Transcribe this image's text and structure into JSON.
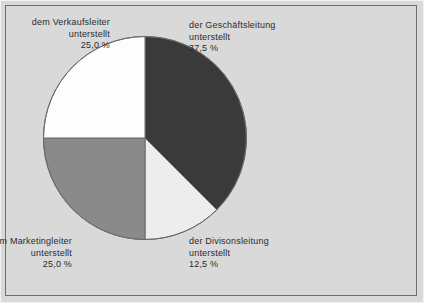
{
  "chart_data": {
    "type": "pie",
    "title": "",
    "subtitle": "",
    "xlabel": "",
    "ylabel": "",
    "legend_position": "none",
    "grid": false,
    "start_angle_deg": 0,
    "direction": "clockwise",
    "categories": [
      "der Geschäftsleitung unterstellt",
      "der Divisonsleitung unterstellt",
      "dem Marketingleiter unterstellt",
      "dem Verkaufsleiter unterstellt"
    ],
    "values": [
      37.5,
      12.5,
      25.0,
      25.0
    ],
    "value_labels": [
      "37,5 %",
      "12,5 %",
      "25,0 %",
      "25,0 %"
    ],
    "colors": [
      "#3a3a3a",
      "#ededed",
      "#8a8a8a",
      "#fdfdfd"
    ],
    "slices": [
      {
        "name_line1": "der Geschäftsleitung",
        "name_line2": "unterstellt",
        "value_label": "37,5 %",
        "value": 37.5,
        "color": "#3a3a3a",
        "align": "left"
      },
      {
        "name_line1": "der Divisonsleitung",
        "name_line2": "unterstellt",
        "value_label": "12,5 %",
        "value": 12.5,
        "color": "#ededed",
        "align": "left"
      },
      {
        "name_line1": "dem Marketingleiter",
        "name_line2": "unterstellt",
        "value_label": "25,0 %",
        "value": 25.0,
        "color": "#8a8a8a",
        "align": "right"
      },
      {
        "name_line1": "dem Verkaufsleiter",
        "name_line2": "unterstellt",
        "value_label": "25,0 %",
        "value": 25.0,
        "color": "#fdfdfd",
        "align": "right"
      }
    ],
    "geometry": {
      "center_x": 145,
      "center_y": 138,
      "radius": 102
    },
    "style": {
      "background": "#d9d9d9",
      "frame_color": "#6f6f6f",
      "outline_color": "#6b6b6b",
      "text_color": "#2b2b2b"
    }
  }
}
